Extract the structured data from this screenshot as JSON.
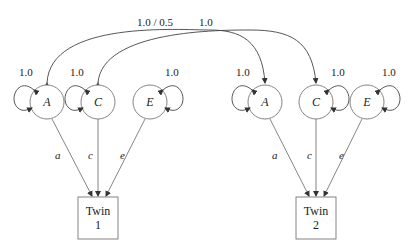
{
  "diagram": {
    "type": "ACE twin model path diagram",
    "correlations": {
      "A_label": "1.0 / 0.5",
      "C_label": "1.0"
    },
    "twins": [
      {
        "box_line1": "Twin",
        "box_line2": "1",
        "latents": [
          {
            "name": "A",
            "variance": "1.0",
            "path": "a"
          },
          {
            "name": "C",
            "variance": "1.0",
            "path": "c"
          },
          {
            "name": "E",
            "variance": "1.0",
            "path": "e"
          }
        ]
      },
      {
        "box_line1": "Twin",
        "box_line2": "2",
        "latents": [
          {
            "name": "A",
            "variance": "1.0",
            "path": "a"
          },
          {
            "name": "C",
            "variance": "1.0",
            "path": "c"
          },
          {
            "name": "E",
            "variance": "1.0",
            "path": "e"
          }
        ]
      }
    ]
  }
}
